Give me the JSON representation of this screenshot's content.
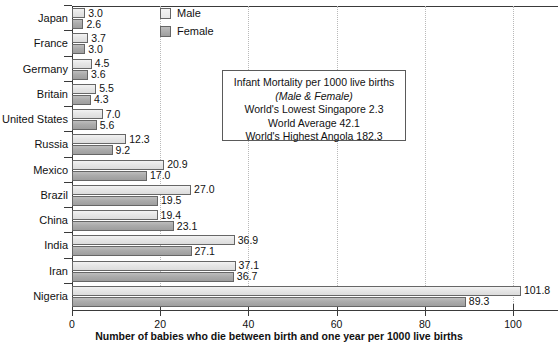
{
  "chart_data": {
    "type": "bar",
    "orientation": "horizontal",
    "title": "Infant Mortality",
    "xlabel": "Number of babies who die between birth and one year per 1000 live births",
    "ylabel": "",
    "xlim": [
      0,
      113
    ],
    "xticks": [
      0,
      20,
      40,
      60,
      80,
      100
    ],
    "xtick_labels": [
      "0",
      "20",
      "40",
      "60",
      "80",
      "100"
    ],
    "grid": true,
    "legend_position": "top-center",
    "categories": [
      "Japan",
      "France",
      "Germany",
      "Britain",
      "United States",
      "Russia",
      "Mexico",
      "Brazil",
      "China",
      "India",
      "Iran",
      "Nigeria"
    ],
    "series": [
      {
        "name": "Male",
        "color": "#e6e6e6",
        "values": [
          3.0,
          3.7,
          4.5,
          5.5,
          7.0,
          12.3,
          20.9,
          27.0,
          19.4,
          36.9,
          37.1,
          101.8
        ],
        "labels": [
          "3.0",
          "3.7",
          "4.5",
          "5.5",
          "7.0",
          "12.3",
          "20.9",
          "27.0",
          "19.4",
          "36.9",
          "37.1",
          "101.8"
        ]
      },
      {
        "name": "Female",
        "color": "#a8a8a8",
        "values": [
          2.6,
          3.0,
          3.6,
          4.3,
          5.6,
          9.2,
          17.0,
          19.5,
          23.1,
          27.1,
          36.7,
          89.3
        ],
        "labels": [
          "2.6",
          "3.0",
          "3.6",
          "4.3",
          "5.6",
          "9.2",
          "17.0",
          "19.5",
          "23.1",
          "27.1",
          "36.7",
          "89.3"
        ]
      }
    ],
    "annotations": {
      "info_box": [
        "Infant Mortality per 1000 live births",
        "(Male & Female)",
        "World's Lowest Singapore 2.3",
        "World Average 42.1",
        "World's Highest Angola 182.3"
      ]
    }
  },
  "legend": {
    "items": [
      {
        "label": "Male"
      },
      {
        "label": "Female"
      }
    ]
  }
}
